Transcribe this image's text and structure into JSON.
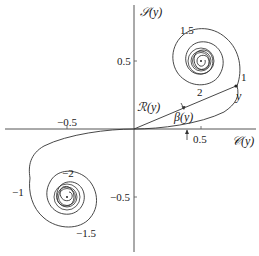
{
  "figure": {
    "type": "Cornu spiral (Euler spiral)",
    "colors": {
      "curve": "#333333",
      "axis": "#555555",
      "text": "#1a1a1a",
      "background": "#ffffff"
    }
  },
  "axes": {
    "x_label": "𝒞(y)",
    "y_label": "𝒮(y)",
    "x_ticks": [
      {
        "value": -0.5,
        "label": "−0.5"
      },
      {
        "value": 0.5,
        "label": "0.5"
      }
    ],
    "y_ticks": [
      {
        "value": 0.5,
        "label": "0.5"
      },
      {
        "value": -0.5,
        "label": "−0.5"
      }
    ]
  },
  "annotations": {
    "radius_label": "ℛ(y)",
    "angle_label": "β(y)",
    "point_label": "y",
    "curve_param_labels": [
      {
        "param": "1",
        "text": "1"
      },
      {
        "param": "1.5",
        "text": "1.5"
      },
      {
        "param": "2",
        "text": "2"
      },
      {
        "param": "-1",
        "text": "−1"
      },
      {
        "param": "-1.5",
        "text": "−1.5"
      },
      {
        "param": "-2",
        "text": "−2"
      }
    ]
  },
  "spiral_centers": [
    {
      "name": "upper",
      "x": 0.5,
      "y": 0.5
    },
    {
      "name": "lower",
      "x": -0.5,
      "y": -0.5
    }
  ]
}
